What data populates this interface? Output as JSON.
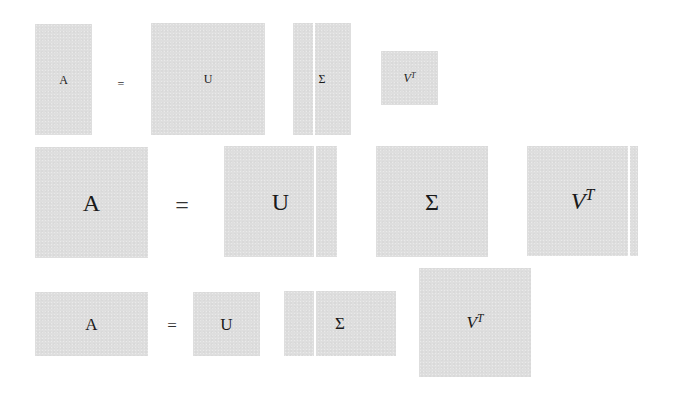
{
  "diagram": {
    "colors": {
      "matrix_fill": "#dedede",
      "divider": "#ffffff",
      "text": "#1a1a1a"
    },
    "rows": [
      {
        "name": "tall",
        "equation": [
          "A",
          "=",
          "U",
          "Σ",
          "V^T"
        ],
        "labels": {
          "a": "A",
          "eq": "=",
          "u": "U",
          "sigma": "Σ",
          "v": "V",
          "t": "T"
        }
      },
      {
        "name": "square",
        "equation": [
          "A",
          "=",
          "U",
          "Σ",
          "V^T"
        ],
        "labels": {
          "a": "A",
          "eq": "=",
          "u": "U",
          "sigma": "Σ",
          "v": "V",
          "t": "T"
        }
      },
      {
        "name": "wide",
        "equation": [
          "A",
          "=",
          "U",
          "Σ",
          "V^T"
        ],
        "labels": {
          "a": "A",
          "eq": "=",
          "u": "U",
          "sigma": "Σ",
          "v": "V",
          "t": "T"
        }
      }
    ]
  }
}
